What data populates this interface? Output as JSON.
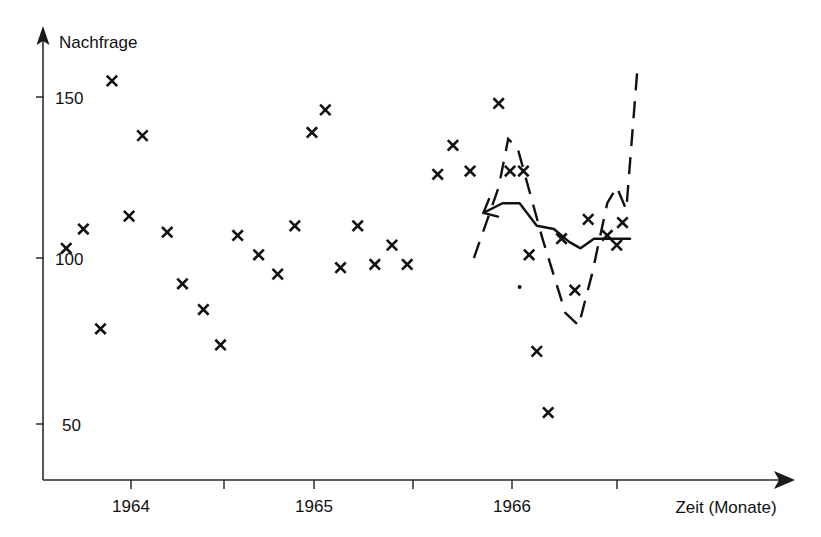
{
  "chart_data": {
    "type": "scatter",
    "title": "",
    "ylabel": "Nachfrage",
    "xlabel": "Zeit (Monate)",
    "ylim": [
      0,
      170
    ],
    "xlim": [
      1963.55,
      1966.75
    ],
    "grid": false,
    "legend": "none",
    "y_ticks": [
      50,
      100,
      150
    ],
    "y_tick_labels": [
      "50",
      "100",
      "150"
    ],
    "x_ticks": [
      1964,
      1964.5,
      1965,
      1965.5,
      1966,
      1966.5
    ],
    "x_tick_labels": [
      "1964",
      "",
      "1965",
      "",
      "1966",
      ""
    ],
    "axis_style": "arrowed-open-axes",
    "marker_symbol": "x",
    "marker_color": "#111111",
    "series": [
      {
        "name": "Nachfrage (Beobachtung)",
        "type": "scatter",
        "marker": "x",
        "points": [
          {
            "x": 1963.66,
            "y": 103
          },
          {
            "x": 1963.75,
            "y": 109
          },
          {
            "x": 1963.84,
            "y": 78
          },
          {
            "x": 1963.9,
            "y": 155
          },
          {
            "x": 1963.99,
            "y": 113
          },
          {
            "x": 1964.06,
            "y": 138
          },
          {
            "x": 1964.19,
            "y": 108
          },
          {
            "x": 1964.27,
            "y": 92
          },
          {
            "x": 1964.38,
            "y": 84
          },
          {
            "x": 1964.47,
            "y": 73
          },
          {
            "x": 1964.56,
            "y": 107
          },
          {
            "x": 1964.67,
            "y": 101
          },
          {
            "x": 1964.77,
            "y": 95
          },
          {
            "x": 1964.86,
            "y": 110
          },
          {
            "x": 1964.95,
            "y": 139
          },
          {
            "x": 1965.02,
            "y": 146
          },
          {
            "x": 1965.1,
            "y": 97
          },
          {
            "x": 1965.19,
            "y": 110
          },
          {
            "x": 1965.28,
            "y": 98
          },
          {
            "x": 1965.37,
            "y": 104
          },
          {
            "x": 1965.45,
            "y": 98
          },
          {
            "x": 1965.61,
            "y": 126
          },
          {
            "x": 1965.69,
            "y": 135
          },
          {
            "x": 1965.78,
            "y": 127
          },
          {
            "x": 1965.93,
            "y": 148
          },
          {
            "x": 1965.99,
            "y": 127
          },
          {
            "x": 1966.06,
            "y": 127
          },
          {
            "x": 1966.09,
            "y": 101
          },
          {
            "x": 1966.13,
            "y": 71
          },
          {
            "x": 1966.19,
            "y": 52
          },
          {
            "x": 1966.26,
            "y": 106
          },
          {
            "x": 1966.33,
            "y": 90
          },
          {
            "x": 1966.4,
            "y": 112
          },
          {
            "x": 1966.5,
            "y": 107
          },
          {
            "x": 1966.55,
            "y": 104
          },
          {
            "x": 1966.58,
            "y": 111
          }
        ]
      },
      {
        "name": "Prognose (geglättet)",
        "type": "line",
        "style": "solid",
        "has_start_arrow": true,
        "points": [
          {
            "x": 1965.85,
            "y": 114
          },
          {
            "x": 1965.95,
            "y": 117
          },
          {
            "x": 1966.04,
            "y": 117
          },
          {
            "x": 1966.13,
            "y": 110
          },
          {
            "x": 1966.22,
            "y": 109
          },
          {
            "x": 1966.3,
            "y": 105
          },
          {
            "x": 1966.36,
            "y": 103
          },
          {
            "x": 1966.43,
            "y": 106
          },
          {
            "x": 1966.62,
            "y": 106
          }
        ]
      },
      {
        "name": "Prognoseband (gestrichelt)",
        "type": "line",
        "style": "dashed",
        "points": [
          {
            "x": 1965.8,
            "y": 100
          },
          {
            "x": 1965.93,
            "y": 122
          },
          {
            "x": 1965.98,
            "y": 137
          },
          {
            "x": 1966.03,
            "y": 134
          },
          {
            "x": 1966.16,
            "y": 106
          },
          {
            "x": 1966.28,
            "y": 83
          },
          {
            "x": 1966.35,
            "y": 79
          },
          {
            "x": 1966.42,
            "y": 95
          },
          {
            "x": 1966.5,
            "y": 117
          },
          {
            "x": 1966.55,
            "y": 122
          },
          {
            "x": 1966.6,
            "y": 115
          },
          {
            "x": 1966.66,
            "y": 160
          }
        ]
      },
      {
        "name": "Einzelpunkt",
        "type": "scatter",
        "marker": "dot",
        "points": [
          {
            "x": 1966.04,
            "y": 91
          }
        ]
      }
    ]
  },
  "labels": {
    "y_axis_title": "Nachfrage",
    "x_axis_title": "Zeit (Monate)",
    "y_150": "150",
    "y_100": "100",
    "y_50": "50",
    "x_1964": "1964",
    "x_1965": "1965",
    "x_1966": "1966"
  }
}
